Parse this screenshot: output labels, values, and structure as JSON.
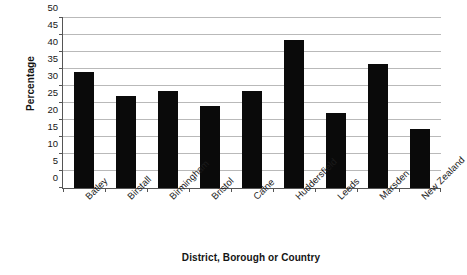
{
  "chart_data": {
    "type": "bar",
    "title": "",
    "xlabel": "District, Borough or Country",
    "ylabel": "Percentage",
    "categories": [
      "Batley",
      "Birstall",
      "Birmingham",
      "Bristol",
      "Calne",
      "Huddersfield",
      "Leeds",
      "Marsden",
      "New Zealand"
    ],
    "values": [
      34,
      27,
      28.5,
      24,
      28.5,
      43.5,
      22,
      36.5,
      17.5
    ],
    "ylim": [
      0,
      50
    ],
    "ytick_step": 5,
    "yticks": [
      0,
      5,
      10,
      15,
      20,
      25,
      30,
      35,
      40,
      45,
      50
    ],
    "ytick_labels": [
      "0",
      "5",
      "10",
      "15",
      "20",
      "25",
      "30",
      "35",
      "40",
      "45",
      "50"
    ],
    "grid": true,
    "legend": false,
    "bar_color": "#0a0a0a",
    "grid_color": "#b9b9b9",
    "axis_color": "#555555"
  }
}
